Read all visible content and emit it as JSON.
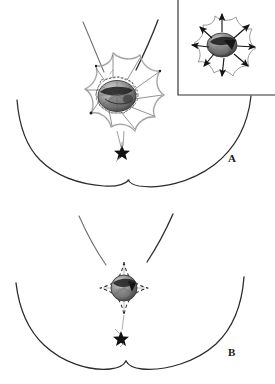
{
  "figure": {
    "panels": [
      {
        "id": "A",
        "label": "A",
        "caption_text": "A",
        "description": "Flower/starburst shaped de-epithelialized flap pattern around the nipple-areola complex on the right breast, with inset detail.",
        "petal_count": 8,
        "marker": "star",
        "has_inset": true
      },
      {
        "id": "B",
        "label": "B",
        "caption_text": "B",
        "description": "Four-pointed dashed star closure pattern around a circular areola on the chest midline.",
        "points": 4,
        "marker": "star",
        "has_inset": false
      }
    ],
    "inset": {
      "label": "",
      "description": "Detail view showing radial arrows indicating advancement of the flap petals toward the center.",
      "arrow_count": 8
    },
    "colors": {
      "ink": "#1a1a1a",
      "line": "#333333",
      "light_line": "#8a8a8a",
      "shade_dark": "#2b2b2b",
      "shade_mid": "#777777",
      "shade_light": "#bdbdbd",
      "background": "#ffffff"
    }
  }
}
